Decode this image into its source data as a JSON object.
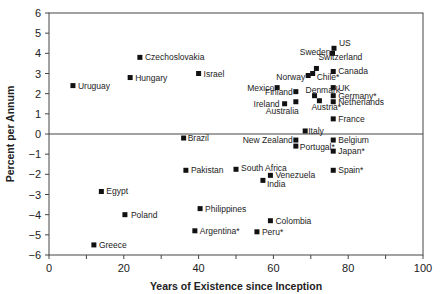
{
  "chart_data": {
    "type": "scatter",
    "title": "",
    "xlabel": "Years of Existence since Inception",
    "ylabel": "Percent per Annum",
    "xlim": [
      0,
      100
    ],
    "ylim": [
      -6,
      6
    ],
    "xticks": [
      0,
      20,
      40,
      60,
      80,
      100
    ],
    "yticks": [
      -6,
      -5,
      -4,
      -3,
      -2,
      -1,
      0,
      1,
      2,
      3,
      4,
      5,
      6
    ],
    "grid": false,
    "legend": null,
    "reference_line_y": 0,
    "points": [
      {
        "label": "US",
        "x": 76.2,
        "y": 4.25,
        "lx": 5,
        "ly": -2,
        "anchor": "start"
      },
      {
        "label": "Sweden",
        "x": 75.8,
        "y": 4.0,
        "lx": -2,
        "ly": 2,
        "anchor": "end"
      },
      {
        "label": "Switzerland",
        "x": 71.5,
        "y": 3.25,
        "lx": 2,
        "ly": -8,
        "anchor": "start"
      },
      {
        "label": "Canada",
        "x": 76.0,
        "y": 3.1,
        "lx": 5,
        "ly": 3,
        "anchor": "start"
      },
      {
        "label": "Norway",
        "x": 69.3,
        "y": 2.9,
        "lx": -3,
        "ly": 4,
        "anchor": "end"
      },
      {
        "label": "Chile*",
        "x": 70.5,
        "y": 3.0,
        "lx": 4,
        "ly": 6,
        "anchor": "start"
      },
      {
        "label": "Mexico",
        "x": 61.0,
        "y": 2.3,
        "lx": -3,
        "ly": 3,
        "anchor": "end"
      },
      {
        "label": "UK",
        "x": 76.0,
        "y": 2.3,
        "lx": 5,
        "ly": 3,
        "anchor": "start"
      },
      {
        "label": "Finland",
        "x": 66.0,
        "y": 2.1,
        "lx": -3,
        "ly": 3,
        "anchor": "end"
      },
      {
        "label": "Denmark",
        "x": 71.0,
        "y": 1.9,
        "lx": -9,
        "ly": -3,
        "anchor": "start"
      },
      {
        "label": "Germany*",
        "x": 76.0,
        "y": 1.9,
        "lx": 5,
        "ly": 3,
        "anchor": "start"
      },
      {
        "label": "Austria*",
        "x": 72.3,
        "y": 1.65,
        "lx": -8,
        "ly": 9,
        "anchor": "start"
      },
      {
        "label": "Netherlands",
        "x": 76.0,
        "y": 1.6,
        "lx": 5,
        "ly": 3,
        "anchor": "start"
      },
      {
        "label": "Ireland",
        "x": 63.0,
        "y": 1.5,
        "lx": -5,
        "ly": 3,
        "anchor": "end"
      },
      {
        "label": "Australia",
        "x": 66.0,
        "y": 1.6,
        "lx": 3,
        "ly": 12,
        "anchor": "end"
      },
      {
        "label": "France",
        "x": 76.0,
        "y": 0.75,
        "lx": 5,
        "ly": 3,
        "anchor": "start"
      },
      {
        "label": "Italy",
        "x": 68.5,
        "y": 0.15,
        "lx": 3,
        "ly": 0,
        "anchor": "start"
      },
      {
        "label": "New Zealand",
        "x": 66.0,
        "y": -0.3,
        "lx": -3,
        "ly": 0,
        "anchor": "end"
      },
      {
        "label": "Portugal*",
        "x": 66.0,
        "y": -0.6,
        "lx": 4,
        "ly": 4,
        "anchor": "start"
      },
      {
        "label": "Belgium",
        "x": 76.0,
        "y": -0.3,
        "lx": 5,
        "ly": 3,
        "anchor": "start"
      },
      {
        "label": "Japan*",
        "x": 76.0,
        "y": -0.85,
        "lx": 5,
        "ly": 3,
        "anchor": "start"
      },
      {
        "label": "Spain*",
        "x": 76.0,
        "y": -1.8,
        "lx": 5,
        "ly": 3,
        "anchor": "start"
      },
      {
        "label": "Czechoslovakia",
        "x": 24.3,
        "y": 3.8,
        "lx": 5,
        "ly": 3,
        "anchor": "start"
      },
      {
        "label": "Hungary",
        "x": 21.7,
        "y": 2.8,
        "lx": 5,
        "ly": 3,
        "anchor": "start"
      },
      {
        "label": "Israel",
        "x": 40.0,
        "y": 3.0,
        "lx": 5,
        "ly": 3,
        "anchor": "start"
      },
      {
        "label": "Uruguay",
        "x": 6.4,
        "y": 2.4,
        "lx": 5,
        "ly": 3,
        "anchor": "start"
      },
      {
        "label": "Brazil",
        "x": 36.0,
        "y": -0.2,
        "lx": 4,
        "ly": 3,
        "anchor": "start"
      },
      {
        "label": "Pakistan",
        "x": 36.6,
        "y": -1.8,
        "lx": 5,
        "ly": 3,
        "anchor": "start"
      },
      {
        "label": "South Africa",
        "x": 50.0,
        "y": -1.75,
        "lx": 5,
        "ly": 2,
        "anchor": "start"
      },
      {
        "label": "Venezuela",
        "x": 59.2,
        "y": -2.05,
        "lx": 5,
        "ly": 3,
        "anchor": "start"
      },
      {
        "label": "India",
        "x": 57.2,
        "y": -2.3,
        "lx": 4,
        "ly": 7,
        "anchor": "start"
      },
      {
        "label": "Egypt",
        "x": 14.0,
        "y": -2.85,
        "lx": 5,
        "ly": 3,
        "anchor": "start"
      },
      {
        "label": "Philippines",
        "x": 40.4,
        "y": -3.7,
        "lx": 5,
        "ly": 3,
        "anchor": "start"
      },
      {
        "label": "Poland",
        "x": 20.3,
        "y": -4.0,
        "lx": 6,
        "ly": 3,
        "anchor": "start"
      },
      {
        "label": "Colombia",
        "x": 59.2,
        "y": -4.3,
        "lx": 5,
        "ly": 3,
        "anchor": "start"
      },
      {
        "label": "Argentina*",
        "x": 39.0,
        "y": -4.8,
        "lx": 5,
        "ly": 3,
        "anchor": "start"
      },
      {
        "label": "Peru*",
        "x": 55.6,
        "y": -4.85,
        "lx": 5,
        "ly": 3,
        "anchor": "start"
      },
      {
        "label": "Greece",
        "x": 12.0,
        "y": -5.5,
        "lx": 5,
        "ly": 3,
        "anchor": "start"
      }
    ]
  }
}
